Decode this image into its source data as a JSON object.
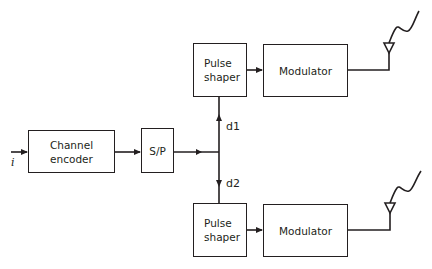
{
  "diagram": {
    "input_label": "i",
    "blocks": {
      "channel_encoder": {
        "line1": "Channel",
        "line2": "encoder"
      },
      "sp": {
        "label": "S/P"
      },
      "pulse_shaper_top": {
        "line1": "Pulse",
        "line2": "shaper"
      },
      "modulator_top": {
        "label": "Modulator"
      },
      "pulse_shaper_bottom": {
        "line1": "Pulse",
        "line2": "shaper"
      },
      "modulator_bottom": {
        "label": "Modulator"
      }
    },
    "branch_labels": {
      "d1": "d1",
      "d2": "d2"
    },
    "line_color": "#231f20"
  }
}
